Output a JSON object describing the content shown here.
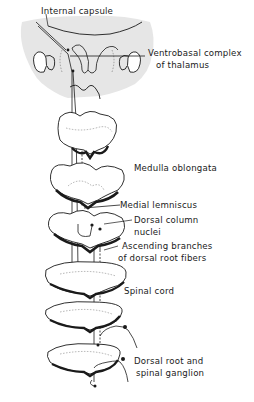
{
  "diagram": {
    "labels": {
      "internal_capsule": "Internal capsule",
      "ventrobasal_line1": "Ventrobasal complex",
      "ventrobasal_line2": "of thalamus",
      "medulla_oblongata": "Medulla oblongata",
      "medial_lemniscus": "Medial lemniscus",
      "dorsal_column_line1": "Dorsal column",
      "dorsal_column_line2": "nuclei",
      "ascending_line1": "Ascending branches",
      "ascending_line2": "of dorsal root fibers",
      "spinal_cord": "Spinal cord",
      "dorsal_root_line1": "Dorsal root and",
      "dorsal_root_line2": "spinal ganglion"
    },
    "colors": {
      "ink": "#1a1a1a",
      "thalamus_fill": "#e6e6e6",
      "background": "#ffffff"
    }
  }
}
